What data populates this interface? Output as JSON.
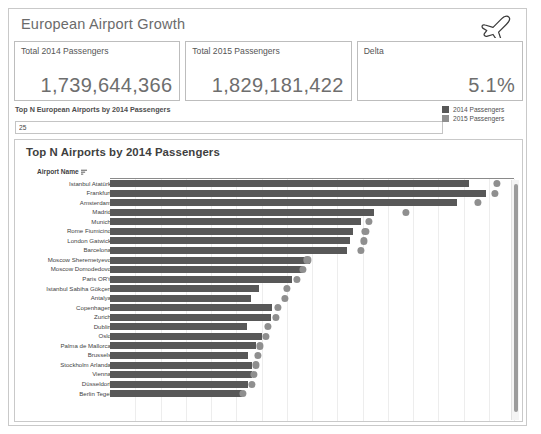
{
  "dashboard": {
    "title": "European Airport Growth",
    "icon": "airplane-icon"
  },
  "kpis": [
    {
      "label": "Total 2014 Passengers",
      "value": "1,739,644,366"
    },
    {
      "label": "Total 2015 Passengers",
      "value": "1,829,181,422"
    },
    {
      "label": "Delta",
      "value": "5.1%"
    }
  ],
  "filter": {
    "label": "Top N European Airports by 2014 Passengers",
    "value": "25"
  },
  "legend": [
    {
      "label": "2014 Passengers",
      "color": "#585858"
    },
    {
      "label": "2015 Passengers",
      "color": "#8f8f8f"
    }
  ],
  "chart_panel": {
    "title": "Top N Airports by 2014 Passengers",
    "column_header": "Airport Name",
    "sort_icon": "sort-descending-icon"
  },
  "chart_data": {
    "type": "bar",
    "title": "Top N Airports by 2014 Passengers",
    "xlabel": "",
    "ylabel": "Airport Name",
    "grid": true,
    "legend_position": "top-right",
    "xlim": [
      0,
      64000000
    ],
    "categories": [
      "Istanbul Atatürk",
      "Frankfurt",
      "Amsterdam",
      "Madrid",
      "Munich",
      "Rome Fiumicino",
      "London Gatwick",
      "Barcelona",
      "Moscow Sheremetyevo",
      "Moscow Domodedovo",
      "Paris ORY",
      "Istanbul Sabiha Gökçen",
      "Antalya",
      "Copenhagen",
      "Zurich",
      "Dublin",
      "Oslo",
      "Palma de Mallorca",
      "Brussels",
      "Stockholm Arlanda",
      "Vienna",
      "Düsseldorf",
      "Berlin Tegel"
    ],
    "series": [
      {
        "name": "2014 Passengers",
        "color": "#585858",
        "mark": "bar",
        "values": [
          56814298,
          59566132,
          54978023,
          41833686,
          39700515,
          38506467,
          38094000,
          37559044,
          31609000,
          30504000,
          28862586,
          23559000,
          22383000,
          25627093,
          25477622,
          21711376,
          24000000,
          23115499,
          21933190,
          22441000,
          22483158,
          21848797,
          20988000
        ]
      },
      {
        "name": "2015 Passengers",
        "color": "#8f8f8f",
        "mark": "dot",
        "values": [
          61322729,
          61032022,
          58284864,
          46828279,
          40981649,
          40463208,
          40269087,
          39711237,
          31286000,
          30504000,
          29665000,
          28017000,
          27724249,
          26610332,
          26281228,
          25049000,
          24678195,
          23745023,
          23460018,
          23143000,
          22775054,
          22476685,
          21005215
        ]
      }
    ]
  }
}
